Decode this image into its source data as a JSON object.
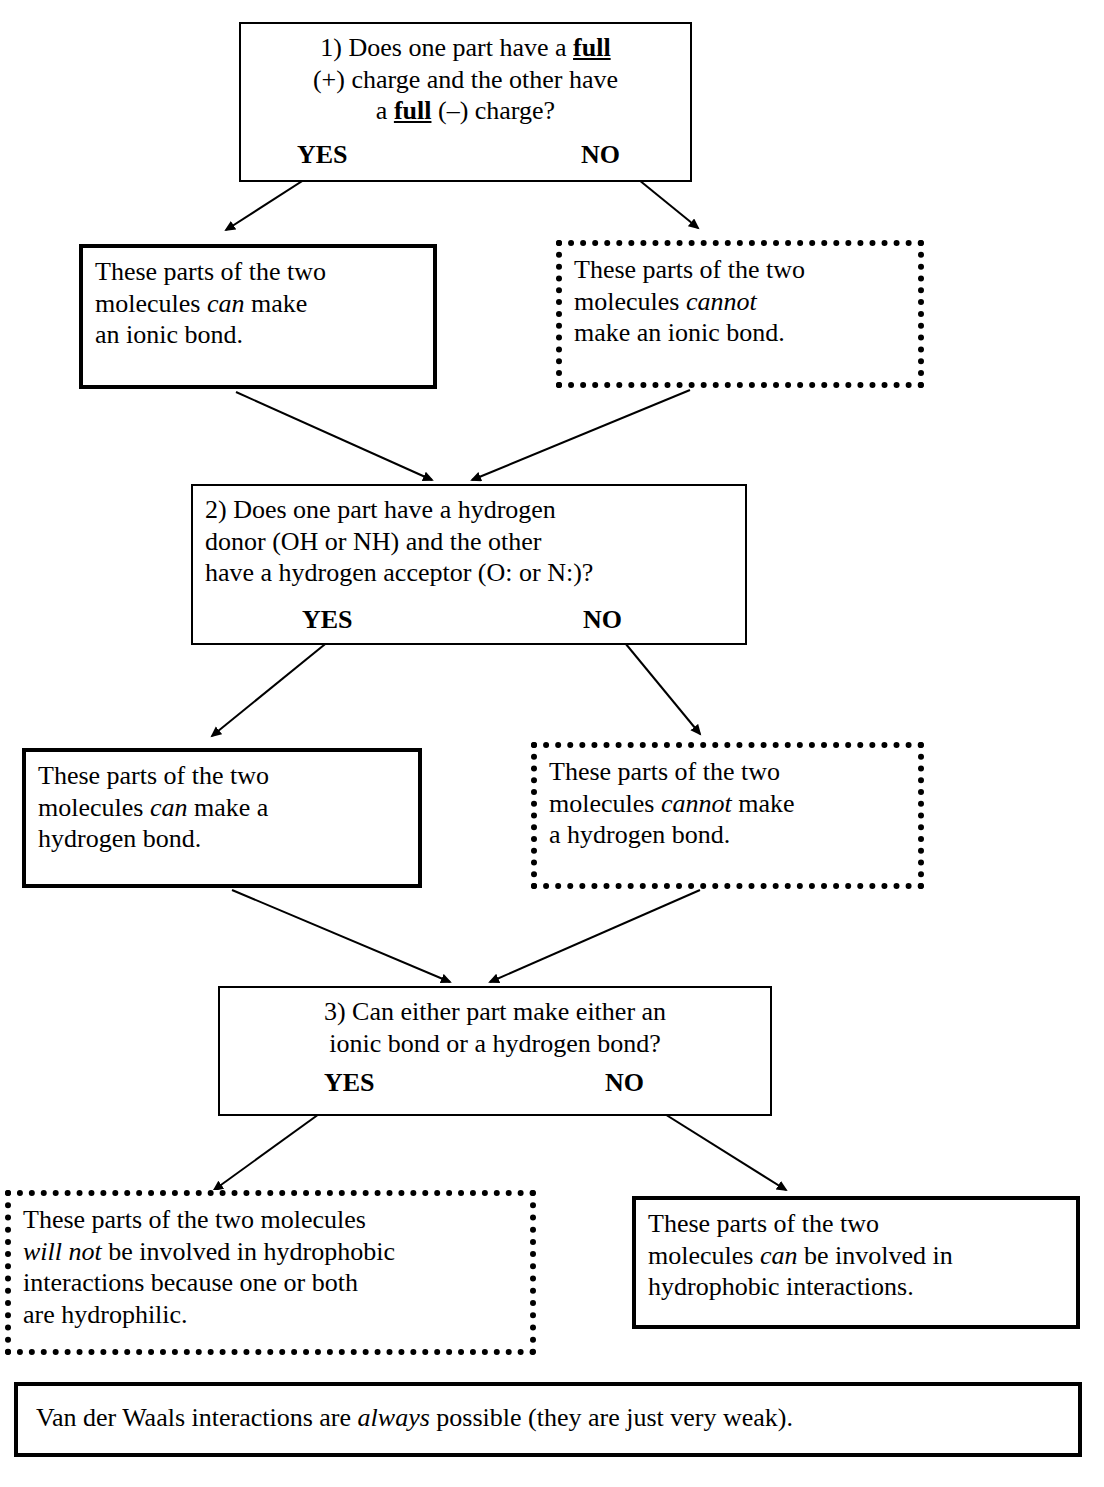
{
  "diagram": {
    "nodes": {
      "q1": {
        "line1": "1) Does one part have a ",
        "emph1": "full",
        "line2": "(+) charge and the other have",
        "line3a": "a ",
        "emph2": "full",
        "line3b": " (–) charge?",
        "yes": "YES",
        "no": "NO"
      },
      "ionic_yes": {
        "line1": "These parts of the two",
        "line2a": "molecules ",
        "emph": "can",
        "line2b": " make",
        "line3": "an ionic bond."
      },
      "ionic_no": {
        "line1": "These parts of the two",
        "line2a": "molecules ",
        "emph": "cannot",
        "line3": "make an ionic bond."
      },
      "q2": {
        "line1": "2) Does one part have a hydrogen",
        "line2": "donor (OH or NH) and the other",
        "line3": "have a hydrogen acceptor (O: or N:)?",
        "yes": "YES",
        "no": "NO"
      },
      "hbond_yes": {
        "line1": "These parts of the two",
        "line2a": "molecules ",
        "emph": "can",
        "line2b": " make a",
        "line3": "hydrogen bond."
      },
      "hbond_no": {
        "line1": "These parts of the two",
        "line2a": "molecules ",
        "emph": "cannot",
        "line2b": " make",
        "line3": "a hydrogen bond."
      },
      "q3": {
        "line1": "3) Can either part make either an",
        "line2": "ionic bond or a hydrogen bond?",
        "yes": "YES",
        "no": "NO"
      },
      "hydrophobic_no": {
        "line1": "These parts of the two molecules",
        "emph": "will not",
        "line2b": " be involved in hydrophobic",
        "line3": "interactions because one or both",
        "line4": "are hydrophilic."
      },
      "hydrophobic_yes": {
        "line1": "These parts of the two",
        "line2a": "molecules ",
        "emph": "can",
        "line2b": " be involved in",
        "line3": "hydrophobic interactions."
      },
      "vdw": {
        "line1": "Van der Waals interactions are ",
        "emph": "always",
        "line2": " possible (they are just very weak)."
      }
    }
  }
}
